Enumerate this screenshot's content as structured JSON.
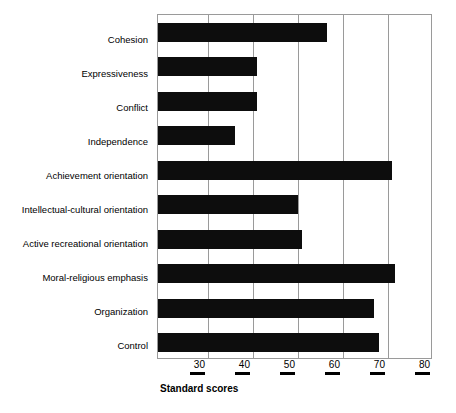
{
  "chart_data": {
    "type": "bar",
    "orientation": "horizontal",
    "title": "",
    "xlabel": "Standard scores",
    "ylabel": "",
    "xlim": [
      18.9,
      80
    ],
    "xticks": [
      30,
      40,
      50,
      60,
      70,
      80
    ],
    "xtick_labels": [
      "30",
      "40",
      "50",
      "60",
      "70",
      "80"
    ],
    "grid": true,
    "legend": null,
    "bar_color": "#0d0d0d",
    "categories": [
      "Cohesion",
      "Expressiveness",
      "Conflict",
      "Independence",
      "Achievement orientation",
      "Intellectual-cultural orientation",
      "Active recreational orientation",
      "Moral-religious emphasis",
      "Organization",
      "Control"
    ],
    "values": [
      56.5,
      41,
      41,
      36,
      71,
      50,
      51,
      71.5,
      67,
      68
    ]
  },
  "axis_title": "Standard scores"
}
